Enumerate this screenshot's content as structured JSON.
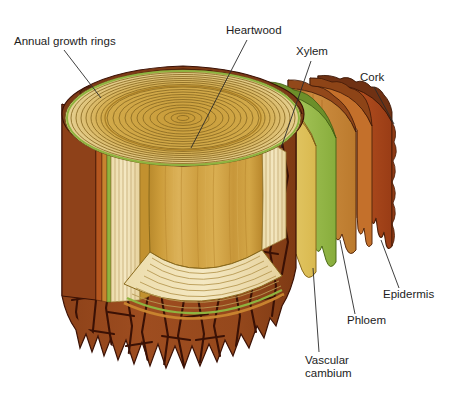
{
  "figure": {
    "background_color": "#ffffff",
    "width": 457,
    "height": 403
  },
  "labels": [
    {
      "id": "annual-growth-rings",
      "text": "Annual growth rings",
      "x": 14,
      "y": 45,
      "anchor": "start",
      "leader": "M 64 50 L 101 98"
    },
    {
      "id": "heartwood",
      "text": "Heartwood",
      "x": 226,
      "y": 34,
      "anchor": "start",
      "leader": "M 247 40 L 191 148"
    },
    {
      "id": "xylem",
      "text": "Xylem",
      "x": 296,
      "y": 55,
      "anchor": "start",
      "leader": "M 311 61 L 281 148"
    },
    {
      "id": "cork",
      "text": "Cork",
      "x": 360,
      "y": 81,
      "anchor": "start",
      "leader": "M 374 87 L 394 124"
    },
    {
      "id": "epidermis",
      "text": "Epidermis",
      "x": 383,
      "y": 298,
      "anchor": "start",
      "leader": "M 399 288 L 381 240"
    },
    {
      "id": "phloem",
      "text": "Phloem",
      "x": 347,
      "y": 324,
      "anchor": "start",
      "leader": "M 355 314 L 340 240"
    },
    {
      "id": "vascular-cambium-line1",
      "text": "Vascular",
      "x": 305,
      "y": 364,
      "anchor": "start",
      "leader": "M 319 352 L 313 268"
    },
    {
      "id": "vascular-cambium-line2",
      "text": "cambium",
      "x": 305,
      "y": 377,
      "anchor": "start",
      "leader": ""
    }
  ],
  "colors": {
    "bark_face": "#9a4a1e",
    "bark_crack": "#3a1105",
    "bark_rim": "#7d3a16",
    "bark_rim_dark": "#5d2a10",
    "cork_slab": "#a7451a",
    "cork_slab_edge": "#8a3512",
    "epidermis_edge": "#c06b2c",
    "phloem_slab": "#c07c2e",
    "phloem_slab_light": "#cf9043",
    "cambium_green": "#8fb33f",
    "cambium_green_light": "#a6c45c",
    "xylem_yellow": "#e4c65f",
    "xylem_yellow_light": "#edd684",
    "sapwood_cream": "#f0e2b2",
    "sapwood_ring_line": "#b89a54",
    "heartwood": "#cc9c3a",
    "heartwood_light": "#dbb055",
    "heartwood_dark": "#b9862c",
    "top_ring_outer": "#e9d79f",
    "top_ring_inner": "#c79a35",
    "ring_line": "#8a6a22",
    "outline": "#3a2408",
    "label_text": "#1c1c1c",
    "leader_line": "#2a2a2a"
  },
  "structure": {
    "layers_outer_to_inner": [
      "Cork",
      "Epidermis",
      "Phloem",
      "Vascular cambium",
      "Xylem",
      "Annual growth rings",
      "Heartwood"
    ],
    "top_face_ring_count": 18,
    "bottom_face_ring_count": 9
  }
}
